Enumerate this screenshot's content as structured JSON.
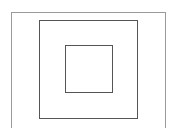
{
  "diagram": {
    "shapes": [
      {
        "id": "outer",
        "type": "rectangle",
        "stroke": "#9a9a9a"
      },
      {
        "id": "middle",
        "type": "square",
        "stroke": "#555555"
      },
      {
        "id": "inner",
        "type": "square",
        "stroke": "#555555"
      }
    ],
    "background": "#ffffff"
  }
}
